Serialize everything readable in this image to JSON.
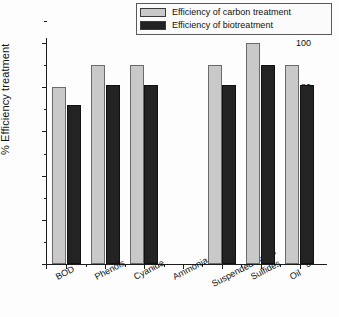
{
  "chart_data": {
    "type": "bar",
    "title": "",
    "xlabel": "",
    "ylabel": "% Efficiency treatment",
    "ylim": [
      0,
      100
    ],
    "yticks": [
      0,
      20,
      40,
      60,
      80,
      100
    ],
    "grid": false,
    "legend_position": "top-right",
    "categories": [
      "BOD",
      "Phenols",
      "Cyanide",
      "Ammonia",
      "Suspended solids",
      "Sulfides",
      "Oil"
    ],
    "series": [
      {
        "name": "Efficiency of carbon treatment",
        "color": "#c9c9c9",
        "values": [
          80,
          90,
          90,
          null,
          90,
          100,
          90
        ]
      },
      {
        "name": "Efficiency of biotreatment",
        "color": "#232323",
        "values": [
          72,
          81,
          81,
          null,
          81,
          90,
          81
        ]
      }
    ]
  },
  "legend": {
    "items": [
      {
        "label": "Efficiency of carbon treatment",
        "swatch": "light"
      },
      {
        "label": "Efficiency of biotreatment",
        "swatch": "dark"
      }
    ]
  },
  "axes": {
    "y_title": "% Efficiency treatment",
    "y_tick_labels": [
      "0",
      "20",
      "40",
      "60",
      "80",
      "100"
    ],
    "x_tick_labels": [
      "BOD",
      "Phenols",
      "Cyanide",
      "Ammonia",
      "Suspended solids",
      "Sulfides",
      "Oil"
    ]
  }
}
